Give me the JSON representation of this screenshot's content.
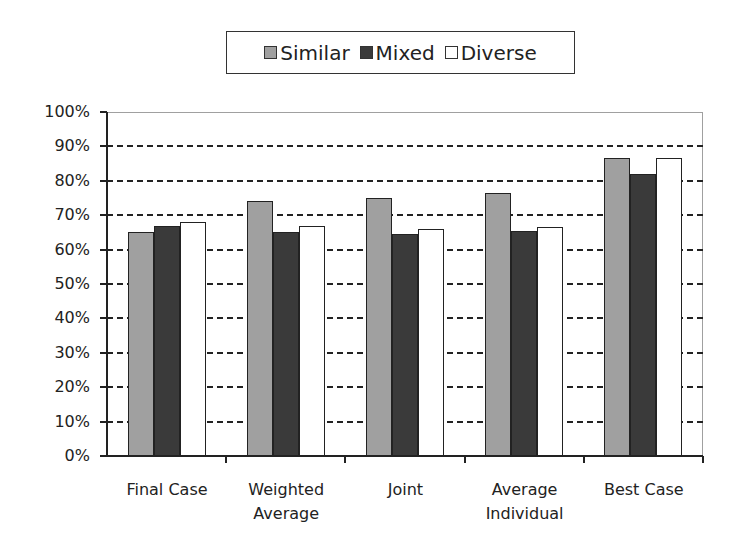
{
  "chart_data": {
    "type": "bar",
    "title": "",
    "xlabel": "",
    "ylabel": "",
    "categories": [
      "Final Case",
      "Weighted Average",
      "Joint",
      "Average Individual",
      "Best Case"
    ],
    "category_label_lines": [
      [
        "Final Case"
      ],
      [
        "Weighted",
        "Average"
      ],
      [
        "Joint"
      ],
      [
        "Average",
        "Individual"
      ],
      [
        "Best Case"
      ]
    ],
    "series": [
      {
        "name": "Similar",
        "color": "#a0a0a0",
        "values": [
          65,
          74,
          75,
          76.5,
          86.5
        ]
      },
      {
        "name": "Mixed",
        "color": "#3a3a3a",
        "values": [
          67,
          65,
          64.5,
          65.5,
          82
        ]
      },
      {
        "name": "Diverse",
        "color": "#ffffff",
        "values": [
          68,
          67,
          66,
          66.5,
          86.5
        ]
      }
    ],
    "ylim": [
      0,
      100
    ],
    "yticks": [
      "0%",
      "10%",
      "20%",
      "30%",
      "40%",
      "50%",
      "60%",
      "70%",
      "80%",
      "90%",
      "100%"
    ],
    "grid": {
      "horizontal": true,
      "style": "dashed"
    },
    "legend": {
      "position": "top",
      "entries": [
        "Similar",
        "Mixed",
        "Diverse"
      ]
    }
  }
}
